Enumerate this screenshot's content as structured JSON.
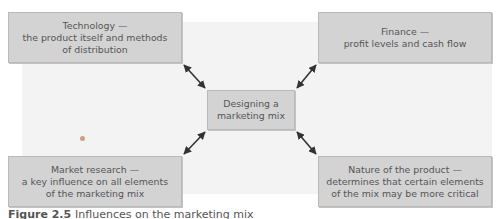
{
  "diagram": {
    "center": {
      "lines": [
        "Designing a",
        "marketing mix"
      ]
    },
    "influences": [
      {
        "position": "top-left",
        "lines": [
          "Technology —",
          "the product itself and methods",
          "of distribution"
        ]
      },
      {
        "position": "top-right",
        "lines": [
          "Finance —",
          "profit levels and cash flow"
        ]
      },
      {
        "position": "bottom-left",
        "lines": [
          "Market research —",
          "a key influence on all elements",
          "of the marketing mix"
        ]
      },
      {
        "position": "bottom-right",
        "lines": [
          "Nature of the product —",
          "determines that certain elements",
          "of the mix may be more critical"
        ]
      }
    ],
    "connector": "double-headed-arrow",
    "colors": {
      "box_fill": "#d3d3d3",
      "box_border": "#b9b9b9",
      "text": "#555555",
      "arrow": "#333333",
      "background_panel": "#f3f3f3"
    }
  },
  "caption": {
    "label": "Figure 2.5",
    "text": "Influences on the marketing mix"
  }
}
